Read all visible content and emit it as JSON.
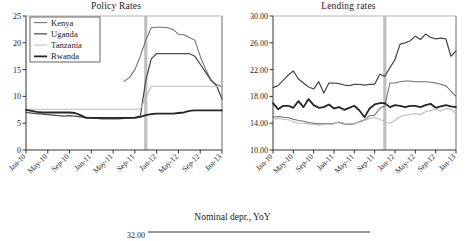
{
  "figure": {
    "footer_title": "Nominal depr., YoY",
    "footer_axis_value": "32.00"
  },
  "chart_data": [
    {
      "id": "policy",
      "type": "line",
      "title": "Policy Rates",
      "xlabel": "",
      "ylabel": "",
      "ylim": [
        0,
        25
      ],
      "yticks": [
        "0",
        "5",
        "10",
        "15",
        "20",
        "25"
      ],
      "grid": false,
      "legend_position": "top-left",
      "legend": [
        "Kenya",
        "Uganda",
        "Tanzania",
        "Rwanda"
      ],
      "colors": {
        "Kenya": "#6e6e6e",
        "Uganda": "#4a4a4a",
        "Tanzania": "#bdbdbd",
        "Rwanda": "#262626"
      },
      "marker_line": {
        "x": "Nov-11",
        "color": "#bfbfbf"
      },
      "x": [
        "Jan-10",
        "May-10",
        "Sep-10",
        "Jan-11",
        "May-11",
        "Sep-11",
        "Jan-12",
        "May-12",
        "Sep-12",
        "Jan-13"
      ],
      "x_months": [
        "Jan-10",
        "Feb-10",
        "Mar-10",
        "Apr-10",
        "May-10",
        "Jun-10",
        "Jul-10",
        "Aug-10",
        "Sep-10",
        "Oct-10",
        "Nov-10",
        "Dec-10",
        "Jan-11",
        "Feb-11",
        "Mar-11",
        "Apr-11",
        "May-11",
        "Jun-11",
        "Jul-11",
        "Aug-11",
        "Sep-11",
        "Oct-11",
        "Nov-11",
        "Dec-11",
        "Jan-12",
        "Feb-12",
        "Mar-12",
        "Apr-12",
        "May-12",
        "Jun-12",
        "Jul-12",
        "Aug-12",
        "Sep-12",
        "Oct-12",
        "Nov-12",
        "Dec-12",
        "Jan-13"
      ],
      "series": [
        {
          "name": "Kenya",
          "values": [
            null,
            null,
            null,
            null,
            null,
            null,
            null,
            null,
            null,
            null,
            null,
            null,
            null,
            null,
            null,
            null,
            null,
            null,
            12.8,
            13.5,
            15.0,
            17.5,
            20.5,
            22.8,
            22.9,
            22.9,
            22.8,
            22.5,
            21.6,
            21.5,
            21.0,
            20.5,
            17.5,
            15.0,
            13.0,
            12.2,
            11.8
          ]
        },
        {
          "name": "Uganda",
          "values": [
            7.0,
            6.9,
            6.8,
            6.7,
            6.6,
            6.5,
            6.4,
            6.3,
            6.4,
            6.3,
            6.2,
            6.1,
            6.0,
            5.9,
            5.8,
            5.8,
            5.8,
            5.8,
            5.9,
            6.0,
            6.1,
            6.3,
            13.0,
            17.0,
            18.0,
            18.0,
            18.0,
            18.0,
            18.0,
            18.0,
            18.0,
            17.5,
            16.0,
            14.5,
            13.0,
            12.0,
            9.5
          ]
        },
        {
          "name": "Tanzania",
          "values": [
            7.6,
            7.6,
            7.6,
            7.6,
            7.6,
            7.6,
            7.6,
            7.6,
            7.6,
            7.6,
            7.6,
            7.6,
            7.6,
            7.6,
            7.6,
            7.6,
            7.6,
            7.6,
            7.6,
            7.6,
            7.6,
            7.6,
            9.8,
            11.9,
            11.9,
            11.9,
            11.9,
            11.9,
            11.9,
            11.9,
            11.9,
            11.9,
            11.9,
            11.9,
            11.9,
            11.9,
            11.9
          ]
        },
        {
          "name": "Rwanda",
          "values": [
            7.5,
            7.3,
            7.1,
            7.0,
            7.0,
            7.0,
            7.0,
            7.0,
            7.0,
            6.9,
            6.5,
            6.0,
            6.0,
            6.0,
            6.0,
            6.0,
            6.0,
            6.0,
            6.0,
            6.0,
            6.0,
            6.2,
            6.5,
            6.7,
            6.8,
            6.8,
            6.8,
            6.8,
            6.9,
            7.0,
            7.3,
            7.4,
            7.4,
            7.4,
            7.4,
            7.4,
            7.4
          ]
        }
      ]
    },
    {
      "id": "lending",
      "type": "line",
      "title": "Lending rates",
      "xlabel": "",
      "ylabel": "",
      "ylim": [
        10,
        30
      ],
      "yticks": [
        "10.00",
        "14.00",
        "18.00",
        "22.00",
        "26.00",
        "30.00"
      ],
      "grid": false,
      "legend_position": "none",
      "legend": [
        "Kenya",
        "Uganda",
        "Tanzania",
        "Rwanda"
      ],
      "colors": {
        "Kenya": "#6e6e6e",
        "Uganda": "#4a4a4a",
        "Tanzania": "#bdbdbd",
        "Rwanda": "#262626"
      },
      "marker_line": {
        "x": "Nov-11",
        "color": "#bfbfbf"
      },
      "x": [
        "Jan-10",
        "May-10",
        "Sep-10",
        "Jan-11",
        "May-11",
        "Sep-11",
        "Jan-12",
        "May-12",
        "Sep-12",
        "Jan-13"
      ],
      "x_months": [
        "Jan-10",
        "Feb-10",
        "Mar-10",
        "Apr-10",
        "May-10",
        "Jun-10",
        "Jul-10",
        "Aug-10",
        "Sep-10",
        "Oct-10",
        "Nov-10",
        "Dec-10",
        "Jan-11",
        "Feb-11",
        "Mar-11",
        "Apr-11",
        "May-11",
        "Jun-11",
        "Jul-11",
        "Aug-11",
        "Sep-11",
        "Oct-11",
        "Nov-11",
        "Dec-11",
        "Jan-12",
        "Feb-12",
        "Mar-12",
        "Apr-12",
        "May-12",
        "Jun-12",
        "Jul-12",
        "Aug-12",
        "Sep-12",
        "Oct-12",
        "Nov-12",
        "Dec-12",
        "Jan-13"
      ],
      "series": [
        {
          "name": "Uganda",
          "values": [
            19.3,
            19.6,
            20.4,
            21.2,
            21.8,
            20.6,
            20.0,
            19.4,
            19.1,
            20.2,
            18.5,
            20.0,
            20.0,
            19.9,
            19.7,
            19.6,
            19.8,
            19.8,
            19.7,
            19.8,
            19.8,
            21.3,
            21.0,
            22.3,
            23.5,
            25.8,
            26.0,
            26.3,
            27.0,
            26.5,
            27.3,
            26.8,
            26.6,
            26.7,
            26.6,
            24.0,
            24.8
          ]
        },
        {
          "name": "Kenya",
          "values": [
            14.9,
            15.0,
            14.9,
            14.8,
            14.6,
            14.4,
            14.3,
            14.1,
            14.0,
            13.9,
            13.9,
            13.9,
            14.0,
            14.1,
            13.9,
            13.8,
            13.9,
            14.2,
            14.5,
            15.1,
            15.2,
            16.2,
            16.6,
            20.0,
            20.0,
            20.2,
            20.3,
            20.3,
            20.2,
            20.2,
            20.2,
            20.1,
            20.0,
            19.8,
            19.6,
            18.8,
            18.0
          ]
        },
        {
          "name": "Rwanda",
          "values": [
            17.0,
            16.1,
            16.6,
            16.6,
            16.3,
            17.3,
            16.4,
            17.6,
            16.7,
            16.3,
            16.4,
            16.8,
            16.2,
            16.4,
            16.0,
            16.3,
            16.6,
            15.9,
            14.9,
            16.2,
            16.8,
            17.0,
            17.0,
            16.4,
            16.7,
            16.6,
            16.4,
            16.6,
            16.6,
            16.4,
            16.7,
            16.9,
            16.3,
            16.5,
            16.7,
            16.5,
            16.4
          ]
        },
        {
          "name": "Tanzania",
          "values": [
            14.6,
            14.7,
            14.6,
            14.5,
            14.2,
            14.0,
            14.0,
            13.9,
            13.8,
            13.7,
            13.8,
            13.8,
            13.9,
            14.2,
            14.0,
            13.9,
            14.0,
            14.1,
            14.4,
            14.7,
            14.8,
            14.6,
            14.2,
            14.0,
            14.4,
            15.0,
            15.2,
            15.3,
            15.4,
            15.3,
            15.7,
            15.9,
            16.1,
            15.8,
            16.2,
            16.1,
            15.4
          ]
        }
      ]
    }
  ]
}
